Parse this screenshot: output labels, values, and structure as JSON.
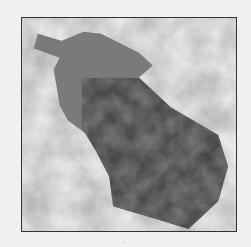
{
  "image": {
    "subject": "eggplant",
    "colors": {
      "background_cloud_light": "#e6e6e6",
      "background_cloud_mid": "#c4c4c4",
      "cap": "#7a7a7a",
      "body_dark": "#3a3a3a",
      "body_mid": "#5a5a5a",
      "frame_border": "#333333"
    }
  },
  "caption": "."
}
